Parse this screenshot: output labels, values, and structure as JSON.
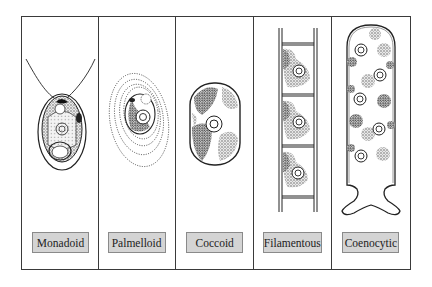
{
  "figure": {
    "panels": [
      {
        "id": "monadoid",
        "label": "Monadoid"
      },
      {
        "id": "palmelloid",
        "label": "Palmelloid"
      },
      {
        "id": "coccoid",
        "label": "Coccoid"
      },
      {
        "id": "filamentous",
        "label": "Filamentous"
      },
      {
        "id": "coenocytic",
        "label": "Coenocytic"
      }
    ]
  },
  "colors": {
    "border": "#3a3a3a",
    "label_fill": "#d4d4d4",
    "label_border": "#8a8a8a",
    "stipple": "#6a6a6a"
  }
}
